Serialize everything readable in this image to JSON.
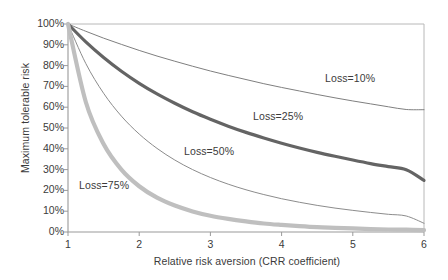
{
  "chart_data": {
    "type": "line",
    "title": "",
    "xlabel": "Relative risk aversion (CRR coefficient)",
    "ylabel": "Maximum tolerable risk",
    "xlim": [
      1,
      6
    ],
    "ylim": [
      0,
      100
    ],
    "grid": false,
    "legend_position": "inline-annotations",
    "xticks": [
      "1",
      "2",
      "3",
      "4",
      "5",
      "6"
    ],
    "xtick_values": [
      1,
      2,
      3,
      4,
      5,
      6
    ],
    "yticks": [
      "0%",
      "10%",
      "20%",
      "30%",
      "40%",
      "50%",
      "60%",
      "70%",
      "80%",
      "90%",
      "100%"
    ],
    "ytick_values": [
      0,
      10,
      20,
      30,
      40,
      50,
      60,
      70,
      80,
      90,
      100
    ],
    "x": [
      1,
      1.25,
      1.5,
      1.75,
      2,
      2.25,
      2.5,
      2.75,
      3,
      3.25,
      3.5,
      3.75,
      4,
      4.25,
      4.5,
      4.75,
      5,
      5.25,
      5.5,
      5.75,
      6
    ],
    "series": [
      {
        "name": "Loss=10%",
        "label": "Loss=10%",
        "color": "#7f7f7f",
        "width": 1.0,
        "values": [
          100.0,
          96.5,
          93.2,
          90.2,
          87.3,
          84.6,
          82.1,
          79.7,
          77.4,
          75.3,
          73.3,
          71.3,
          69.5,
          67.8,
          66.1,
          64.5,
          63.0,
          61.6,
          60.2,
          58.9,
          58.8
        ]
      },
      {
        "name": "Loss=25%",
        "label": "Loss=25%",
        "color": "#646464",
        "width": 3.2,
        "values": [
          100.0,
          91.4,
          83.9,
          77.3,
          71.5,
          66.4,
          61.9,
          57.8,
          54.2,
          50.9,
          47.9,
          45.2,
          42.7,
          40.4,
          38.3,
          36.4,
          34.6,
          32.9,
          31.4,
          29.9,
          24.8
        ]
      },
      {
        "name": "Loss=50%",
        "label": "Loss=50%",
        "color": "#8c8c8c",
        "width": 1.0,
        "values": [
          100.0,
          81.0,
          66.7,
          55.7,
          47.1,
          40.2,
          34.6,
          30.0,
          26.2,
          23.0,
          20.3,
          18.0,
          16.0,
          14.3,
          12.8,
          11.5,
          10.4,
          9.4,
          8.5,
          7.7,
          4.2
        ]
      },
      {
        "name": "Loss=75%",
        "label": "Loss=75%",
        "color": "#bfbfbf",
        "width": 4.2,
        "values": [
          100.0,
          62.5,
          42.3,
          30.0,
          22.0,
          16.5,
          12.7,
          9.9,
          7.8,
          6.3,
          5.1,
          4.1,
          3.4,
          2.8,
          2.3,
          2.0,
          1.7,
          1.4,
          1.2,
          1.1,
          0.9
        ]
      }
    ],
    "annotations": [
      {
        "text": "Loss=10%",
        "x_px": 325,
        "y_px": 72
      },
      {
        "text": "Loss=25%",
        "x_px": 253,
        "y_px": 110
      },
      {
        "text": "Loss=50%",
        "x_px": 184,
        "y_px": 145
      },
      {
        "text": "Loss=75%",
        "x_px": 79,
        "y_px": 179
      }
    ]
  }
}
